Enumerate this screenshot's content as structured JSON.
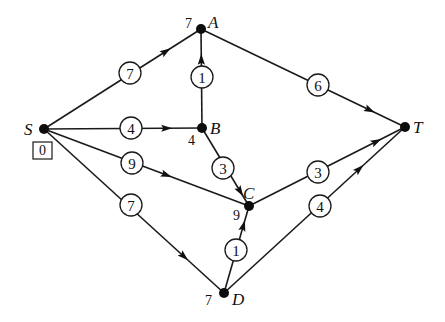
{
  "diagram": {
    "type": "directed weighted graph (shortest path / Dijkstra labels)",
    "nodes": [
      {
        "id": "S",
        "label": "S",
        "x": 44,
        "y": 129,
        "distance": "0",
        "distance_boxed": true,
        "label_pos": "left",
        "dist_pos": "below"
      },
      {
        "id": "A",
        "label": "A",
        "x": 201,
        "y": 29,
        "distance": "7",
        "distance_boxed": false,
        "label_pos": "right",
        "dist_pos": "left"
      },
      {
        "id": "B",
        "label": "B",
        "x": 202,
        "y": 128,
        "distance": "4",
        "distance_boxed": false,
        "label_pos": "right",
        "dist_pos": "below-left"
      },
      {
        "id": "C",
        "label": "C",
        "x": 249,
        "y": 206,
        "distance": "9",
        "distance_boxed": false,
        "label_pos": "above-right",
        "dist_pos": "below-left"
      },
      {
        "id": "D",
        "label": "D",
        "x": 224,
        "y": 293,
        "distance": "7",
        "distance_boxed": false,
        "label_pos": "right",
        "dist_pos": "left"
      },
      {
        "id": "T",
        "label": "T",
        "x": 405,
        "y": 127,
        "distance": null,
        "distance_boxed": false,
        "label_pos": "right",
        "dist_pos": null
      }
    ],
    "edges": [
      {
        "from": "S",
        "to": "A",
        "weight": "7",
        "wx": 130,
        "wy": 73,
        "arrow_t": 0.78
      },
      {
        "from": "S",
        "to": "B",
        "weight": "4",
        "wx": 131,
        "wy": 128,
        "arrow_t": 0.78
      },
      {
        "from": "S",
        "to": "C",
        "weight": "9",
        "wx": 132,
        "wy": 163,
        "arrow_t": 0.6
      },
      {
        "from": "S",
        "to": "D",
        "weight": "7",
        "wx": 131,
        "wy": 205,
        "arrow_t": 0.78
      },
      {
        "from": "B",
        "to": "A",
        "weight": "1",
        "wx": 202,
        "wy": 77,
        "arrow_t": 0.7
      },
      {
        "from": "B",
        "to": "C",
        "weight": "3",
        "wx": 223,
        "wy": 168,
        "arrow_t": 0.82
      },
      {
        "from": "A",
        "to": "T",
        "weight": "6",
        "wx": 318,
        "wy": 85,
        "arrow_t": 0.83
      },
      {
        "from": "C",
        "to": "T",
        "weight": "3",
        "wx": 318,
        "wy": 172,
        "arrow_t": 0.82
      },
      {
        "from": "D",
        "to": "T",
        "weight": "4",
        "wx": 320,
        "wy": 206,
        "arrow_t": 0.75
      },
      {
        "from": "D",
        "to": "C",
        "weight": "1",
        "wx": 236,
        "wy": 250,
        "arrow_t": 0.78
      }
    ]
  },
  "style": {
    "ink": "#111111",
    "background": "#ffffff"
  }
}
